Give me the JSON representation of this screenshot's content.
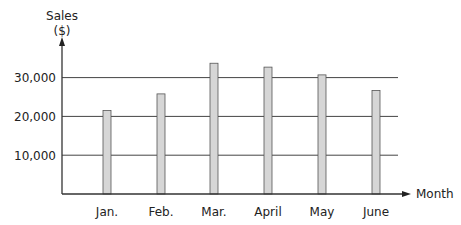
{
  "chart_data": {
    "type": "bar",
    "title": "",
    "xlabel": "Month",
    "ylabel": "Sales ($)",
    "ylabel_lines": [
      "Sales",
      "($)"
    ],
    "categories": [
      "Jan.",
      "Feb.",
      "Mar.",
      "April",
      "May",
      "June"
    ],
    "values": [
      21500,
      25800,
      33700,
      32700,
      30700,
      26700
    ],
    "yticks": [
      10000,
      20000,
      30000
    ],
    "ytick_labels": [
      "10,000",
      "20,000",
      "30,000"
    ],
    "ylim": [
      0,
      40000
    ],
    "grid": true,
    "legend": null,
    "colors": {
      "bar_fill": "#d6d6d6",
      "bar_stroke": "#555555",
      "grid": "#444444",
      "axis": "#333333"
    }
  }
}
